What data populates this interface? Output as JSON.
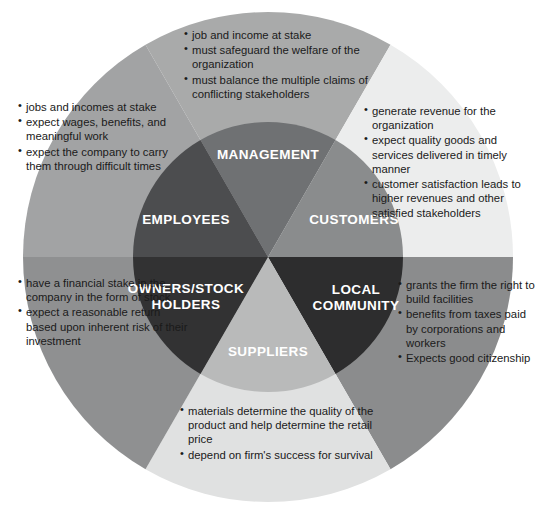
{
  "diagram": {
    "center": {
      "x": 268,
      "y": 257
    },
    "outer_radius": 245,
    "inner_radius": 135,
    "segments": [
      {
        "key": "management",
        "label": "MANAGEMENT",
        "inner_color": "#6f7173",
        "outer_color": "#a9aaaa",
        "label_x": 268,
        "label_y": 155,
        "start_deg": -120,
        "end_deg": -60
      },
      {
        "key": "customers",
        "label": "CUSTOMERS",
        "inner_color": "#8a8c8d",
        "outer_color": "#eceded",
        "label_x": 354,
        "label_y": 220,
        "start_deg": -60,
        "end_deg": 0
      },
      {
        "key": "community",
        "label": "LOCAL\nCOMMUNITY",
        "inner_color": "#2d2d2e",
        "outer_color": "#8b8c8d",
        "label_x": 356,
        "label_y": 298,
        "start_deg": 0,
        "end_deg": 60
      },
      {
        "key": "suppliers",
        "label": "SUPPLIERS",
        "inner_color": "#b9baba",
        "outer_color": "#e0e1e1",
        "label_x": 268,
        "label_y": 352,
        "start_deg": 60,
        "end_deg": 120
      },
      {
        "key": "owners",
        "label": "OWNERS/STOCK\nHOLDERS",
        "inner_color": "#323233",
        "outer_color": "#8f9091",
        "label_x": 186,
        "label_y": 297,
        "start_deg": 120,
        "end_deg": 180
      },
      {
        "key": "employees",
        "label": "EMPLOYEES",
        "inner_color": "#4c4d4f",
        "outer_color": "#a2a3a4",
        "label_x": 186,
        "label_y": 220,
        "start_deg": 180,
        "end_deg": 240
      }
    ]
  },
  "notes": {
    "management": [
      {
        "indent": 0,
        "text": "job and income at stake"
      },
      {
        "indent": 0,
        "text": "must safeguard the welfare of the organization"
      },
      {
        "indent": 0,
        "text": "must balance the multiple claims of conflicting stakeholders"
      }
    ],
    "customers": [
      {
        "indent": 0,
        "text": "generate revenue for the organization"
      },
      {
        "indent": 1,
        "text": "expect quality goods and services delivered in timely manner"
      },
      {
        "indent": 2,
        "text": "customer satisfaction leads to higher revenues and other satisfied stakeholders"
      }
    ],
    "employees": [
      {
        "indent": 2,
        "text": "jobs and incomes at stake"
      },
      {
        "indent": 1,
        "text": "expect wages, benefits, and meaningful work"
      },
      {
        "indent": 0,
        "text": "expect the company to carry them through difficult times"
      }
    ],
    "owners": [
      {
        "indent": 0,
        "text": "have a financial stake in the company in the form of stock"
      },
      {
        "indent": 1,
        "text": "expect a reasonable return based upon inherent risk of their investment"
      }
    ],
    "community": [
      {
        "indent": 1,
        "text": "grants the firm the right to build facilities"
      },
      {
        "indent": 0,
        "text": "benefits from taxes paid by corporations and workers"
      },
      {
        "indent": 0,
        "text": "Expects good citizenship"
      }
    ],
    "suppliers": [
      {
        "indent": 0,
        "text": "materials determine the quality of the product and help determine the retail price"
      },
      {
        "indent": 0,
        "text": "depend on firm's success for survival"
      }
    ]
  },
  "bullet_glyph": "•"
}
